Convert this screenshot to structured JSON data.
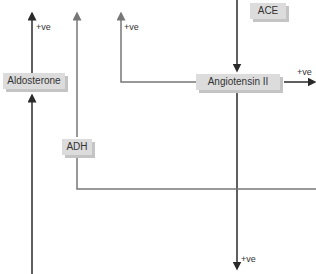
{
  "diagram": {
    "nodes": {
      "ace": "ACE",
      "angiotensin_ii": "Angiotensin II",
      "aldosterone": "Aldosterone",
      "adh": "ADH"
    },
    "effect_labels": {
      "aldosterone_up": "+ve",
      "ang_branch_up": "+ve",
      "ang_right": "+ve",
      "ang_down": "+ve"
    }
  },
  "colors": {
    "line_dark": "#2a2a2a",
    "line_grey": "#777777",
    "box_fill": "#dcdcdc",
    "box_shadow": "#c4c4c4"
  }
}
